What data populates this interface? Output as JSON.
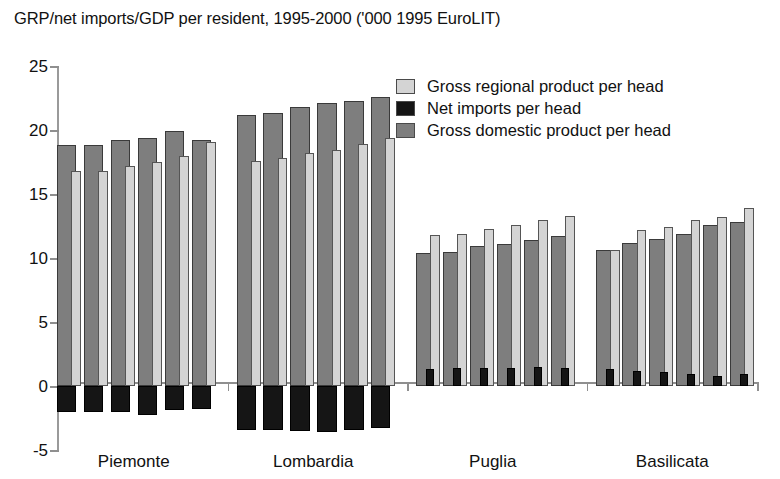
{
  "chart_data": {
    "type": "bar",
    "title": "GRP/net imports/GDP per resident, 1995-2000 ('000 1995 EuroLIT)",
    "xlabel": "",
    "ylabel": "",
    "ylim": [
      -5,
      25
    ],
    "yticks": [
      -5,
      0,
      5,
      10,
      15,
      20,
      25
    ],
    "ytick_labels": [
      "-5",
      "0",
      "5",
      "10",
      "15",
      "20",
      "25"
    ],
    "grid": false,
    "legend_position": "top-right",
    "x": [
      "1995",
      "1996",
      "1997",
      "1998",
      "1999",
      "2000"
    ],
    "categories": [
      "Piemonte",
      "Lombardia",
      "Puglia",
      "Basilicata"
    ],
    "legend": [
      {
        "name": "Gross regional product per head",
        "color": "#d4d4d4"
      },
      {
        "name": "Net imports per head",
        "color": "#151515"
      },
      {
        "name": "Gross domestic product per head",
        "color": "#7e7e7e"
      }
    ],
    "groups": [
      {
        "region": "Piemonte",
        "series": [
          {
            "name": "Gross domestic product per head",
            "values": [
              18.8,
              18.8,
              19.2,
              19.4,
              19.9,
              19.2
            ]
          },
          {
            "name": "Gross regional product per head",
            "values": [
              16.8,
              16.8,
              17.2,
              17.5,
              18.0,
              19.1
            ]
          },
          {
            "name": "Net imports per head",
            "values": [
              -2.0,
              -2.0,
              -2.0,
              -2.3,
              -1.9,
              -1.8
            ]
          }
        ]
      },
      {
        "region": "Lombardia",
        "series": [
          {
            "name": "Gross domestic product per head",
            "values": [
              21.2,
              21.3,
              21.8,
              22.1,
              22.3,
              22.6
            ]
          },
          {
            "name": "Gross regional product per head",
            "values": [
              17.6,
              17.8,
              18.2,
              18.4,
              18.9,
              19.4
            ]
          },
          {
            "name": "Net imports per head",
            "values": [
              -3.4,
              -3.4,
              -3.5,
              -3.6,
              -3.4,
              -3.3
            ]
          }
        ]
      },
      {
        "region": "Puglia",
        "series": [
          {
            "name": "Gross domestic product per head",
            "values": [
              10.4,
              10.5,
              10.9,
              11.1,
              11.4,
              11.7
            ]
          },
          {
            "name": "Gross regional product per head",
            "values": [
              11.8,
              11.9,
              12.3,
              12.6,
              13.0,
              13.3
            ]
          },
          {
            "name": "Net imports per head",
            "values": [
              1.3,
              1.4,
              1.4,
              1.4,
              1.5,
              1.4
            ]
          }
        ]
      },
      {
        "region": "Basilicata",
        "series": [
          {
            "name": "Gross domestic product per head",
            "values": [
              10.6,
              11.2,
              11.5,
              11.9,
              12.6,
              12.8
            ]
          },
          {
            "name": "Gross regional product per head",
            "values": [
              10.6,
              12.2,
              12.4,
              13.0,
              13.2,
              13.9
            ]
          },
          {
            "name": "Net imports per head",
            "values": [
              1.3,
              1.2,
              1.1,
              0.9,
              0.8,
              0.9
            ]
          }
        ]
      }
    ]
  }
}
